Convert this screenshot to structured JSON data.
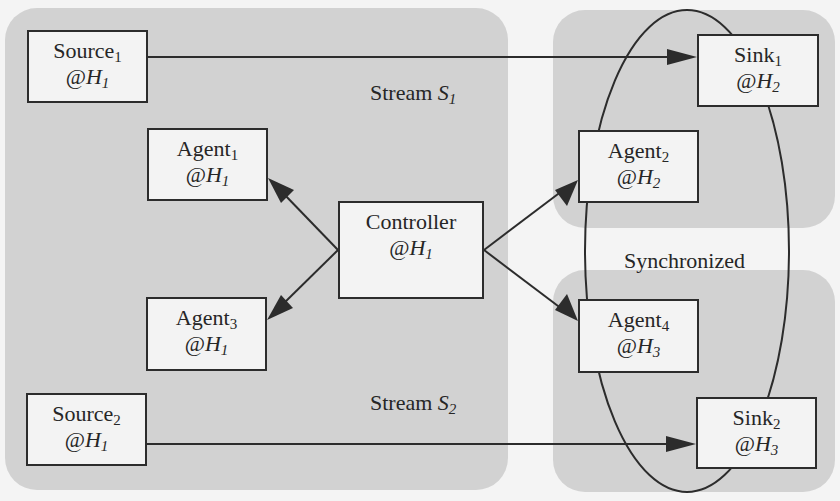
{
  "colors": {
    "background": "#f4f4f4",
    "region": "#d2d2d2",
    "node_fill": "#f3f3f3",
    "stroke": "#2c2c2c"
  },
  "regions": [
    {
      "id": "host-h1-region",
      "x": 5,
      "y": 8,
      "w": 503,
      "h": 482
    },
    {
      "id": "host-h2-region",
      "x": 553,
      "y": 10,
      "w": 282,
      "h": 218
    },
    {
      "id": "host-h3-region",
      "x": 553,
      "y": 270,
      "w": 282,
      "h": 222
    }
  ],
  "nodes": [
    {
      "id": "source1",
      "name": "Source",
      "sub": "1",
      "host": "H",
      "host_sub": "1",
      "x": 27,
      "y": 30,
      "w": 121,
      "h": 73
    },
    {
      "id": "agent1",
      "name": "Agent",
      "sub": "1",
      "host": "H",
      "host_sub": "1",
      "x": 147,
      "y": 128,
      "w": 121,
      "h": 73
    },
    {
      "id": "controller",
      "name": "Controller",
      "sub": "",
      "host": "H",
      "host_sub": "1",
      "x": 338,
      "y": 201,
      "w": 146,
      "h": 98
    },
    {
      "id": "agent3",
      "name": "Agent",
      "sub": "3",
      "host": "H",
      "host_sub": "1",
      "x": 146,
      "y": 297,
      "w": 121,
      "h": 74
    },
    {
      "id": "source2",
      "name": "Source",
      "sub": "2",
      "host": "H",
      "host_sub": "1",
      "x": 26,
      "y": 393,
      "w": 121,
      "h": 73
    },
    {
      "id": "sink1",
      "name": "Sink",
      "sub": "1",
      "host": "H",
      "host_sub": "2",
      "x": 697,
      "y": 34,
      "w": 122,
      "h": 73
    },
    {
      "id": "agent2",
      "name": "Agent",
      "sub": "2",
      "host": "H",
      "host_sub": "2",
      "x": 578,
      "y": 130,
      "w": 121,
      "h": 73
    },
    {
      "id": "agent4",
      "name": "Agent",
      "sub": "4",
      "host": "H",
      "host_sub": "3",
      "x": 578,
      "y": 299,
      "w": 121,
      "h": 74
    },
    {
      "id": "sink2",
      "name": "Sink",
      "sub": "2",
      "host": "H",
      "host_sub": "3",
      "x": 696,
      "y": 397,
      "w": 121,
      "h": 72
    }
  ],
  "labels": {
    "stream1": {
      "text": "Stream ",
      "var": "S",
      "sub": "1"
    },
    "stream2": {
      "text": "Stream ",
      "var": "S",
      "sub": "2"
    },
    "synchronized": {
      "text": "Synchronized"
    }
  },
  "edges": [
    {
      "from": "source1",
      "to": "sink1",
      "label": "Stream S1"
    },
    {
      "from": "source2",
      "to": "sink2",
      "label": "Stream S2"
    },
    {
      "from": "controller",
      "to": "agent1"
    },
    {
      "from": "controller",
      "to": "agent3"
    },
    {
      "from": "controller",
      "to": "agent2"
    },
    {
      "from": "controller",
      "to": "agent4"
    }
  ],
  "groupings": [
    {
      "name": "Synchronized",
      "members": [
        "sink1",
        "agent2",
        "agent4",
        "sink2"
      ],
      "shape": "ellipse"
    }
  ]
}
